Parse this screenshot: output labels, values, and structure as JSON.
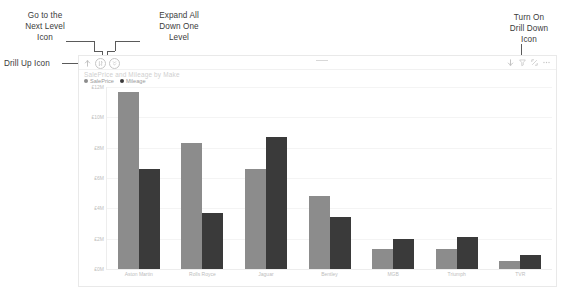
{
  "annotations": [
    {
      "id": "next-level",
      "text": "Go to the\nNext Level\nIcon"
    },
    {
      "id": "expand-all",
      "text": "Expand All\nDown One\nLevel"
    },
    {
      "id": "drill-down",
      "text": "Turn On\nDrill Down\nIcon"
    },
    {
      "id": "drill-up",
      "text": "Drill Up Icon"
    }
  ],
  "visual": {
    "header": {
      "left_icons": [
        {
          "name": "drill-up-icon",
          "glyph": "↑"
        },
        {
          "name": "go-to-next-level-icon",
          "glyph": "⇵"
        },
        {
          "name": "expand-all-down-one-level-icon",
          "glyph": "⇊"
        }
      ],
      "right_icons": [
        {
          "name": "drill-down-toggle-icon",
          "glyph": "↓"
        },
        {
          "name": "filter-icon",
          "glyph": "▽"
        },
        {
          "name": "focus-mode-icon",
          "glyph": "⤢"
        },
        {
          "name": "more-options-icon",
          "glyph": "⋯"
        }
      ]
    }
  },
  "chart_data": {
    "type": "bar",
    "title": "SalePrice and Mileage by Make",
    "xlabel": "",
    "ylabel": "",
    "grid": true,
    "legend_position": "top-left",
    "categories": [
      "Aston Martin",
      "Rolls Royce",
      "Jaguar",
      "Bentley",
      "MGB",
      "Triumph",
      "TVR"
    ],
    "series": [
      {
        "name": "SalePrice",
        "color": "#8c8c8c",
        "values": [
          11.7,
          8.3,
          6.6,
          4.8,
          1.3,
          1.35,
          0.55
        ]
      },
      {
        "name": "Mileage",
        "color": "#3a3a3a",
        "values": [
          6.6,
          3.7,
          8.7,
          3.4,
          2.0,
          2.1,
          0.95
        ]
      }
    ],
    "ylim": [
      0,
      12
    ],
    "yticks": [
      12,
      10,
      8,
      6,
      4,
      2,
      0
    ],
    "ytick_labels": [
      "£12M",
      "£10M",
      "£8M",
      "£6M",
      "£4M",
      "£2M",
      "£0M"
    ]
  }
}
